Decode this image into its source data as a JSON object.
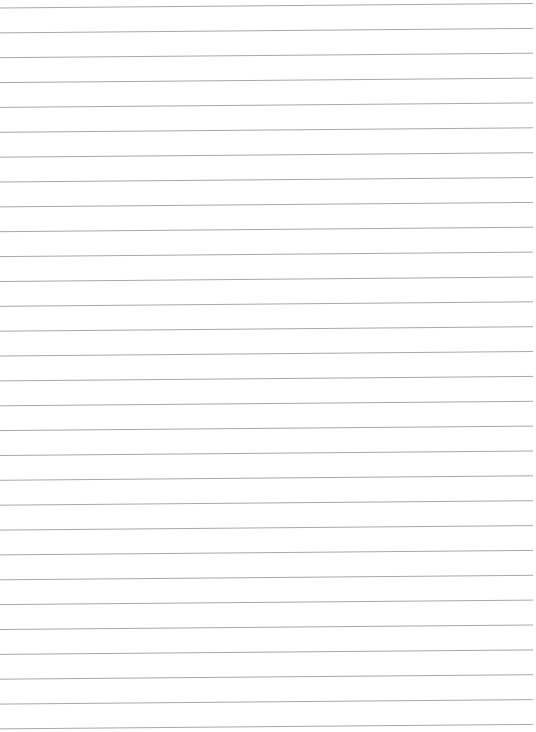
{
  "page": {
    "kind": "lined paper",
    "background": "#ffffff",
    "line_color": "#a8a8a8",
    "line_count": 30,
    "first_line_y_left": 8,
    "first_line_y_right": 3.5,
    "spacing": 24.86,
    "line_start_x": 0,
    "line_end_x": 533
  }
}
